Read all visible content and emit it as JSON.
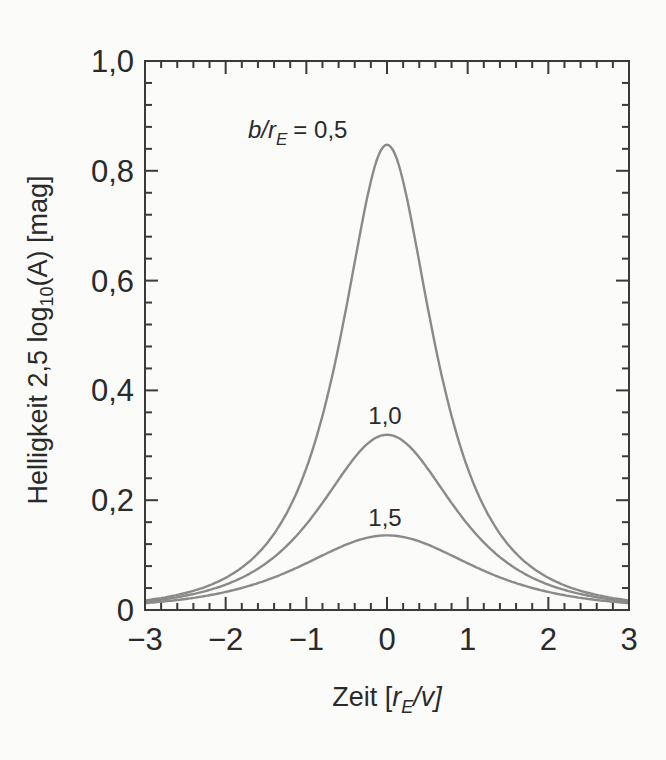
{
  "chart_data": {
    "type": "line",
    "title": "",
    "xlabel": "Zeit [r_E/v]",
    "ylabel": "Helligkeit 2,5 log10(A) [mag]",
    "xlim": [
      -3,
      3
    ],
    "ylim": [
      0,
      1.0
    ],
    "grid": false,
    "legend": "inline labels above curve peaks",
    "x_ticks": [
      "-3",
      "-2",
      "-1",
      "0",
      "1",
      "2",
      "3"
    ],
    "y_ticks": [
      "0",
      "0,2",
      "0,4",
      "0,6",
      "0,8",
      "1,0"
    ],
    "x_minor_per_major": 5,
    "y_minor_per_major": 5,
    "line_color": "#8a8a8a",
    "x": [
      -3,
      -2.5,
      -2,
      -1.5,
      -1,
      -0.75,
      -0.5,
      -0.25,
      0,
      0.25,
      0.5,
      0.75,
      1,
      1.5,
      2,
      2.5,
      3
    ],
    "series": [
      {
        "name": "b/r_E = 0,5",
        "label": "b/r_E = 0,5",
        "b": 0.5,
        "values": [
          0.015,
          0.031,
          0.069,
          0.163,
          0.386,
          0.549,
          0.725,
          0.827,
          0.84,
          0.827,
          0.725,
          0.549,
          0.386,
          0.163,
          0.069,
          0.031,
          0.015
        ]
      },
      {
        "name": "b/r_E = 1,0",
        "label": "1,0",
        "b": 1.0,
        "values": [
          0.013,
          0.027,
          0.052,
          0.105,
          0.182,
          0.232,
          0.276,
          0.306,
          0.317,
          0.306,
          0.276,
          0.232,
          0.182,
          0.105,
          0.052,
          0.027,
          0.013
        ]
      },
      {
        "name": "b/r_E = 1,5",
        "label": "1,5",
        "b": 1.5,
        "values": [
          0.01,
          0.018,
          0.031,
          0.05,
          0.073,
          0.088,
          0.106,
          0.124,
          0.133,
          0.124,
          0.106,
          0.088,
          0.073,
          0.05,
          0.031,
          0.018,
          0.01
        ]
      }
    ]
  },
  "labels": {
    "ylabel_main": "Helligkeit 2,5 log",
    "ylabel_sub": "10",
    "ylabel_tail": "(A) [mag]",
    "xlabel_main": "Zeit [",
    "xlabel_r": "r",
    "xlabel_sub": "E",
    "xlabel_tail": "/v]",
    "curve_label_05_prefix": "b/r",
    "curve_label_05_sub": "E",
    "curve_label_05_value": "= 0,5",
    "curve_label_10": "1,0",
    "curve_label_15": "1,5"
  }
}
